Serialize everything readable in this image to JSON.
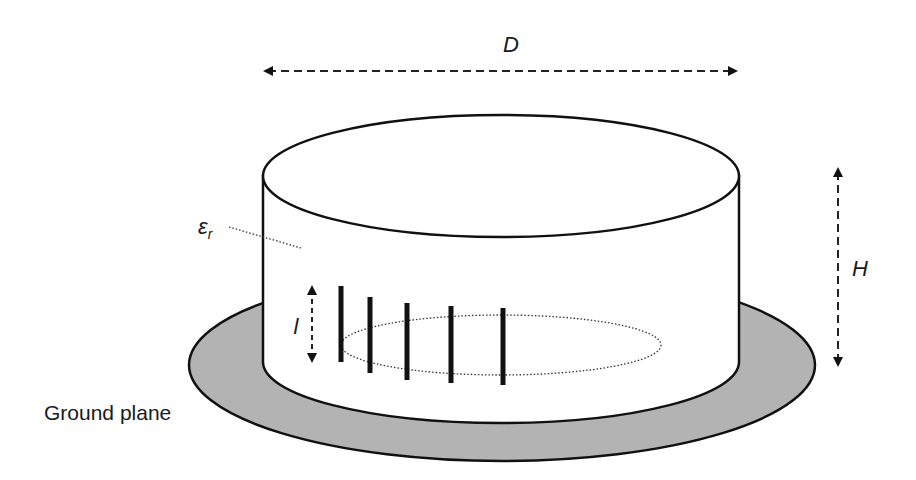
{
  "diagram": {
    "labels": {
      "diameter": "D",
      "height": "H",
      "monopole_length": "l",
      "permittivity": "ε",
      "permittivity_sub": "r",
      "ground_plane": "Ground plane"
    },
    "colors": {
      "ground_plane_fill": "#b3b3b3",
      "stroke": "#111111",
      "cylinder_fill": "#ffffff"
    },
    "monopole_count": 5
  }
}
